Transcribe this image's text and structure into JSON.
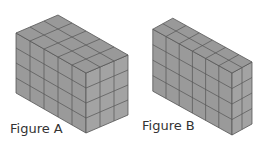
{
  "figures": [
    {
      "label": "Figure A",
      "origin": [
        86,
        133
      ],
      "u": [
        -14,
        -8
      ],
      "v": [
        14,
        -6
      ],
      "h": 15,
      "counts": {
        "left": 5,
        "right": 3,
        "height": 4
      },
      "label_pos": [
        10,
        122
      ]
    },
    {
      "label": "Figure B",
      "origin": [
        232,
        135
      ],
      "u": [
        -13.2,
        -7.3
      ],
      "v": [
        10,
        -5.5
      ],
      "h": 15.5,
      "counts": {
        "left": 6,
        "right": 2,
        "height": 4
      },
      "label_pos": [
        142,
        119
      ]
    }
  ],
  "colors": {
    "face_left": "#9a9a9a",
    "face_right": "#a3a3a3",
    "face_top": "#999999",
    "grid_line": "#555555",
    "label": "#333333"
  }
}
